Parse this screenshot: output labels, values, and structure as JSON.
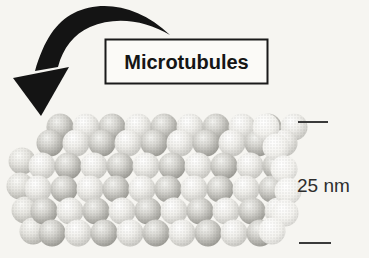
{
  "diagram": {
    "title_label": "Microtubules",
    "scale_label": "25 nm",
    "colors": {
      "paper": "#f6f5f1",
      "ink": "#141414",
      "scale_text": "#2e2e2e",
      "sphere_highlight": "#ffffff",
      "sphere_shadow": "#96958f"
    }
  }
}
